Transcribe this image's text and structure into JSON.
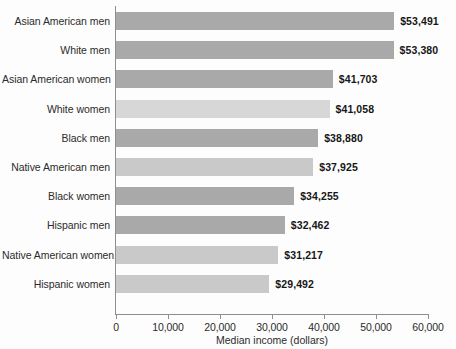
{
  "chart_data": {
    "type": "bar",
    "orientation": "horizontal",
    "title": "",
    "xlabel": "Median income (dollars)",
    "ylabel": "",
    "xlim": [
      0,
      60000
    ],
    "xticks": [
      0,
      10000,
      20000,
      30000,
      40000,
      50000,
      60000
    ],
    "xticklabels": [
      "0",
      "10,000",
      "20,000",
      "30,000",
      "40,000",
      "50,000",
      "60,000"
    ],
    "grid": false,
    "legend": null,
    "categories": [
      "Asian American men",
      "White men",
      "Asian American women",
      "White women",
      "Black men",
      "Native American men",
      "Black women",
      "Hispanic men",
      "Native American women",
      "Hispanic women"
    ],
    "values": [
      53491,
      53380,
      41703,
      41058,
      38880,
      37925,
      34255,
      32462,
      31217,
      29492
    ],
    "value_labels": [
      "$53,491",
      "$53,380",
      "$41,703",
      "$41,058",
      "$38,880",
      "$37,925",
      "$34,255",
      "$32,462",
      "$31,217",
      "$29,492"
    ],
    "bar_shades": [
      "dark",
      "dark",
      "dark",
      "lighter",
      "dark",
      "light",
      "dark",
      "dark",
      "light",
      "light"
    ],
    "colors": {
      "bar_dark": "#a9a9a9",
      "bar_light": "#c9c9c9",
      "bar_lighter": "#d7d7d7",
      "axis": "#8e8e8e",
      "text": "#2b2b2b",
      "value_text": "#171717",
      "background": "#fdfdfd"
    }
  }
}
